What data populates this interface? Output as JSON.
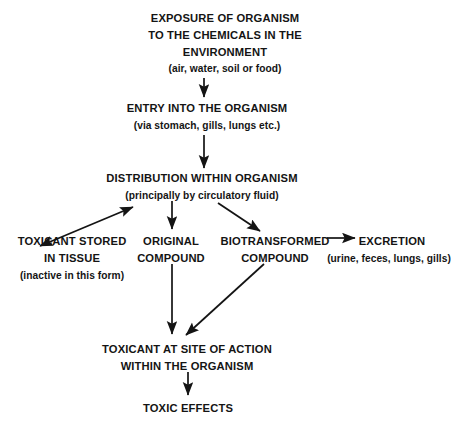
{
  "diagram": {
    "background_color": "#ffffff",
    "text_color": "#141414",
    "nodes": {
      "exposure": {
        "line1": "EXPOSURE OF ORGANISM",
        "line2": "TO THE CHEMICALS IN THE",
        "line3": "ENVIRONMENT",
        "detail": "(air, water, soil or food)"
      },
      "entry": {
        "line1": "ENTRY INTO THE ORGANISM",
        "detail": "(via stomach, gills, lungs etc.)"
      },
      "distribution": {
        "line1": "DISTRIBUTION WITHIN ORGANISM",
        "detail": "(principally by circulatory fluid)"
      },
      "stored": {
        "line1": "TOXICANT STORED",
        "line2": "IN TISSUE",
        "detail": "(inactive in this form)"
      },
      "original": {
        "line1": "ORIGINAL",
        "line2": "COMPOUND"
      },
      "biotransformed": {
        "line1": "BIOTRANSFORMED",
        "line2": "COMPOUND"
      },
      "excretion": {
        "line1": "EXCRETION",
        "detail": "(urine, feces, lungs, gills)"
      },
      "site_of_action": {
        "line1": "TOXICANT AT SITE OF ACTION",
        "line2": "WITHIN THE ORGANISM"
      },
      "toxic_effects": {
        "line1": "TOXIC EFFECTS"
      }
    },
    "edges": [
      {
        "id": "exposure-to-entry",
        "from": "exposure",
        "to": "entry",
        "style": "straight-down",
        "heads": 1
      },
      {
        "id": "entry-to-distribution",
        "from": "entry",
        "to": "distribution",
        "style": "straight-down",
        "heads": 1
      },
      {
        "id": "distribution-to-stored",
        "from": "distribution",
        "to": "stored",
        "style": "diagonal-left",
        "heads": 2
      },
      {
        "id": "distribution-to-original",
        "from": "distribution",
        "to": "original",
        "style": "straight-down",
        "heads": 1
      },
      {
        "id": "distribution-to-biotransformed",
        "from": "distribution",
        "to": "biotransformed",
        "style": "diagonal-right",
        "heads": 1
      },
      {
        "id": "biotransformed-to-excretion",
        "from": "biotransformed",
        "to": "excretion",
        "style": "horizontal-right",
        "heads": 1
      },
      {
        "id": "original-to-site",
        "from": "original",
        "to": "site_of_action",
        "style": "straight-down",
        "heads": 1
      },
      {
        "id": "biotransformed-to-site",
        "from": "biotransformed",
        "to": "site_of_action",
        "style": "diagonal-left-down",
        "heads": 1
      },
      {
        "id": "site-to-effects",
        "from": "site_of_action",
        "to": "toxic_effects",
        "style": "straight-down",
        "heads": 1
      }
    ]
  }
}
